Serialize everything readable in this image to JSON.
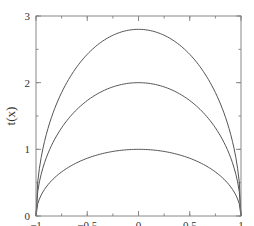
{
  "chart_data": {
    "type": "line",
    "title": "",
    "xlabel": "x/N",
    "ylabel": "t(x)",
    "xlim": [
      -1,
      1
    ],
    "ylim": [
      0,
      3
    ],
    "grid": false,
    "legend": "none",
    "x_ticks": [
      -1,
      -0.5,
      0,
      0.5,
      1
    ],
    "x_tick_labels": [
      "−1",
      "−0.5",
      "0",
      "0.5",
      "1"
    ],
    "x_minor_step": 0.25,
    "y_ticks": [
      0,
      1,
      2,
      3
    ],
    "y_tick_labels": [
      "0",
      "1",
      "2",
      "3"
    ],
    "y_minor_step": 0.5,
    "series": [
      {
        "name": "curve-peak-2.8",
        "x": [
          -1,
          -0.9,
          -0.75,
          -0.5,
          -0.25,
          0,
          0.25,
          0.5,
          0.75,
          0.9,
          1
        ],
        "values": [
          0,
          1.22,
          1.85,
          2.42,
          2.71,
          2.8,
          2.71,
          2.42,
          1.85,
          1.22,
          0
        ]
      },
      {
        "name": "curve-peak-2",
        "x": [
          -1,
          -0.9,
          -0.75,
          -0.5,
          -0.25,
          0,
          0.25,
          0.5,
          0.75,
          0.9,
          1
        ],
        "values": [
          0,
          0.87,
          1.32,
          1.73,
          1.94,
          2.0,
          1.94,
          1.73,
          1.32,
          0.87,
          0
        ]
      },
      {
        "name": "curve-peak-1",
        "x": [
          -1,
          -0.9,
          -0.75,
          -0.5,
          -0.25,
          0,
          0.25,
          0.5,
          0.75,
          0.9,
          1
        ],
        "values": [
          0,
          0.44,
          0.66,
          0.87,
          0.97,
          1.0,
          0.97,
          0.87,
          0.66,
          0.44,
          0
        ]
      }
    ],
    "peak_values": [
      2.8,
      2.0,
      1.0
    ],
    "line_color": "#555555",
    "axis_color": "#888888"
  }
}
